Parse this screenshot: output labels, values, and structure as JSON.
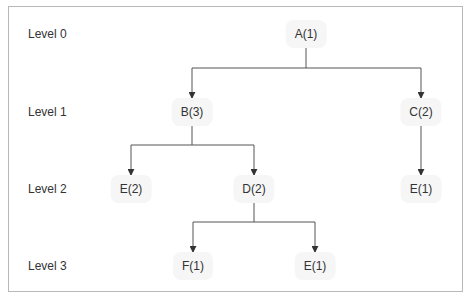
{
  "levels": [
    {
      "label": "Level 0",
      "y": 34
    },
    {
      "label": "Level 1",
      "y": 112
    },
    {
      "label": "Level 2",
      "y": 189
    },
    {
      "label": "Level 3",
      "y": 266
    }
  ],
  "nodes": [
    {
      "id": "A",
      "label": "A(1)",
      "level": 0,
      "x": 306,
      "y": 34
    },
    {
      "id": "B",
      "label": "B(3)",
      "level": 1,
      "x": 192,
      "y": 112
    },
    {
      "id": "C",
      "label": "C(2)",
      "level": 1,
      "x": 421,
      "y": 112
    },
    {
      "id": "E2",
      "label": "E(2)",
      "level": 2,
      "x": 131,
      "y": 189
    },
    {
      "id": "D",
      "label": "D(2)",
      "level": 2,
      "x": 254,
      "y": 189
    },
    {
      "id": "E1a",
      "label": "E(1)",
      "level": 2,
      "x": 421,
      "y": 189
    },
    {
      "id": "F",
      "label": "F(1)",
      "level": 3,
      "x": 193,
      "y": 266
    },
    {
      "id": "E1b",
      "label": "E(1)",
      "level": 3,
      "x": 315,
      "y": 266
    }
  ],
  "edges": [
    {
      "from": "A",
      "to": "B"
    },
    {
      "from": "A",
      "to": "C"
    },
    {
      "from": "B",
      "to": "E2"
    },
    {
      "from": "B",
      "to": "D"
    },
    {
      "from": "C",
      "to": "E1a"
    },
    {
      "from": "D",
      "to": "F"
    },
    {
      "from": "D",
      "to": "E1b"
    }
  ],
  "colors": {
    "line": "#444444",
    "border": "#b8b8b8",
    "node_bg": "#f6f6f6",
    "text": "#333333"
  }
}
